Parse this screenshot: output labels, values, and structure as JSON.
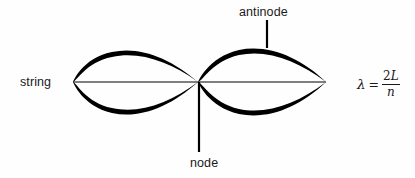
{
  "figure": {
    "background_color": "#fefefe",
    "ink_color": "#000000",
    "text_color": "#1a1a1a"
  },
  "labels": {
    "string": "string",
    "antinode": "antinode",
    "node": "node"
  },
  "formula": {
    "symbol": "λ",
    "equals": "=",
    "numerator_coefficient": "2",
    "numerator_variable": "L",
    "denominator": "n",
    "plain": "λ = 2L/n"
  },
  "geometry": {
    "axis_y": 82,
    "left_end_x": 73,
    "node_x": 198,
    "right_end_x": 326,
    "lobe_top_y": 50,
    "lobe_bottom_y": 115,
    "antinode_leader_x": 267,
    "antinode_leader_top_y": 20,
    "antinode_leader_bottom_y": 48,
    "node_leader_x": 199,
    "node_leader_top_y": 82,
    "node_leader_bottom_y": 152,
    "harmonic_number": 2,
    "node_count": 3,
    "antinode_count": 2
  }
}
